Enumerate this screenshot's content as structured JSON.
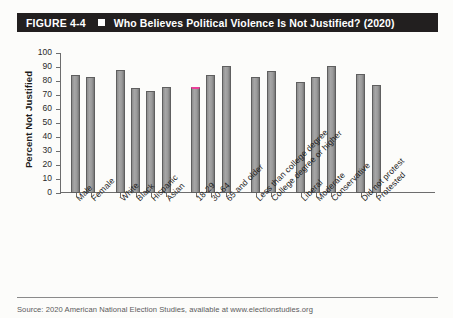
{
  "figure": {
    "number": "FIGURE 4-4",
    "title": "Who Believes Political Violence Is Not Justified? (2020)",
    "bar_color": "#9a9a9a",
    "header_bg": "#221f1f",
    "header_fg": "#ffffff",
    "highlight_color": "#ec3f9a"
  },
  "source": {
    "text": "Source: 2020 American National Election Studies, available at www.electionstudies.org"
  },
  "chart_data": {
    "type": "bar",
    "title": "Who Believes Political Violence Is Not Justified? (2020)",
    "xlabel": "",
    "ylabel": "Percent Not Justified",
    "ylim": [
      0,
      100
    ],
    "yticks": [
      0,
      10,
      20,
      30,
      40,
      50,
      60,
      70,
      80,
      90,
      100
    ],
    "grid": false,
    "legend": "none",
    "categories": [
      "Male",
      "Female",
      "White",
      "Black",
      "Hispanic",
      "Asian",
      "18-29",
      "30-64",
      "65 and older",
      "Less than college degree",
      "College degree or higher",
      "Liberal",
      "Moderate",
      "Conservative",
      "Did not protest",
      "Protested"
    ],
    "values": [
      84,
      83,
      88,
      75,
      73,
      76,
      76,
      84,
      91,
      83,
      87,
      79,
      83,
      91,
      85,
      77
    ],
    "groups": [
      {
        "name": "Gender",
        "count": 2
      },
      {
        "name": "Race/Ethnicity",
        "count": 4
      },
      {
        "name": "Age",
        "count": 3
      },
      {
        "name": "Education",
        "count": 2
      },
      {
        "name": "Ideology",
        "count": 3
      },
      {
        "name": "Protest",
        "count": 2
      }
    ],
    "highlighted_index": 6
  }
}
